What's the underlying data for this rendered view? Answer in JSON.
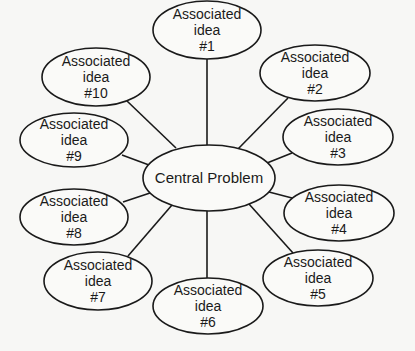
{
  "diagram": {
    "type": "mind-map",
    "center": {
      "label": "Central Problem",
      "cx": 209,
      "cy": 178,
      "rx": 66,
      "ry": 33
    },
    "nodes": [
      {
        "id": 1,
        "lines": [
          "Associated",
          "idea",
          "#1"
        ],
        "cx": 207,
        "cy": 30,
        "rx": 54,
        "ry": 29
      },
      {
        "id": 2,
        "lines": [
          "Associated",
          "idea",
          "#2"
        ],
        "cx": 315,
        "cy": 73,
        "rx": 55,
        "ry": 28
      },
      {
        "id": 3,
        "lines": [
          "Associated",
          "idea",
          "#3"
        ],
        "cx": 338,
        "cy": 137,
        "rx": 55,
        "ry": 28
      },
      {
        "id": 4,
        "lines": [
          "Associated",
          "idea",
          "#4"
        ],
        "cx": 339,
        "cy": 213,
        "rx": 55,
        "ry": 28
      },
      {
        "id": 5,
        "lines": [
          "Associated",
          "idea",
          "#5"
        ],
        "cx": 318,
        "cy": 278,
        "rx": 55,
        "ry": 28
      },
      {
        "id": 6,
        "lines": [
          "Associated",
          "idea",
          "#6"
        ],
        "cx": 208,
        "cy": 306,
        "rx": 55,
        "ry": 28
      },
      {
        "id": 7,
        "lines": [
          "Associated",
          "idea",
          "#7"
        ],
        "cx": 98,
        "cy": 281,
        "rx": 54,
        "ry": 29
      },
      {
        "id": 8,
        "lines": [
          "Associated",
          "idea",
          "#8"
        ],
        "cx": 74,
        "cy": 217,
        "rx": 54,
        "ry": 28
      },
      {
        "id": 9,
        "lines": [
          "Associated",
          "idea",
          "#9"
        ],
        "cx": 74,
        "cy": 140,
        "rx": 54,
        "ry": 27
      },
      {
        "id": 10,
        "lines": [
          "Associated",
          "idea",
          "#10"
        ],
        "cx": 96,
        "cy": 77,
        "rx": 54,
        "ry": 29
      }
    ],
    "edges": [
      {
        "to": 1,
        "x1": 207,
        "y1": 145,
        "x2": 207,
        "y2": 59
      },
      {
        "to": 2,
        "x1": 238,
        "y1": 149,
        "x2": 288,
        "y2": 98
      },
      {
        "to": 3,
        "x1": 267,
        "y1": 163,
        "x2": 292,
        "y2": 153
      },
      {
        "to": 4,
        "x1": 269,
        "y1": 192,
        "x2": 292,
        "y2": 198
      },
      {
        "to": 5,
        "x1": 249,
        "y1": 204,
        "x2": 293,
        "y2": 253
      },
      {
        "to": 6,
        "x1": 207,
        "y1": 211,
        "x2": 207,
        "y2": 278
      },
      {
        "to": 7,
        "x1": 172,
        "y1": 205,
        "x2": 128,
        "y2": 256
      },
      {
        "to": 8,
        "x1": 150,
        "y1": 193,
        "x2": 123,
        "y2": 202
      },
      {
        "to": 9,
        "x1": 149,
        "y1": 165,
        "x2": 122,
        "y2": 155
      },
      {
        "to": 10,
        "x1": 176,
        "y1": 148,
        "x2": 127,
        "y2": 101
      }
    ]
  }
}
